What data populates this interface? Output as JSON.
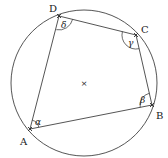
{
  "diagram": {
    "circle": {
      "cx": 84,
      "cy": 83,
      "r": 73,
      "center_marker": "×"
    },
    "vertices": [
      {
        "id": "A",
        "label": "A",
        "x": 30,
        "y": 129,
        "label_x": 20,
        "label_y": 145
      },
      {
        "id": "B",
        "label": "B",
        "x": 152,
        "y": 105,
        "label_x": 156,
        "label_y": 119
      },
      {
        "id": "C",
        "label": "C",
        "x": 136,
        "y": 35,
        "label_x": 141,
        "label_y": 33
      },
      {
        "id": "D",
        "label": "D",
        "x": 59,
        "y": 16,
        "label_x": 49,
        "label_y": 12
      }
    ],
    "angles": [
      {
        "vertex": "A",
        "label": "α",
        "label_x": 35,
        "label_y": 125
      },
      {
        "vertex": "B",
        "label": "β",
        "label_x": 140,
        "label_y": 103
      },
      {
        "vertex": "C",
        "label": "γ",
        "label_x": 128,
        "label_y": 46
      },
      {
        "vertex": "D",
        "label": "δ",
        "label_x": 61,
        "label_y": 28
      }
    ],
    "colors": {
      "line": "#2a2a2a",
      "text": "#1a1a1a",
      "background": "#ffffff"
    }
  }
}
